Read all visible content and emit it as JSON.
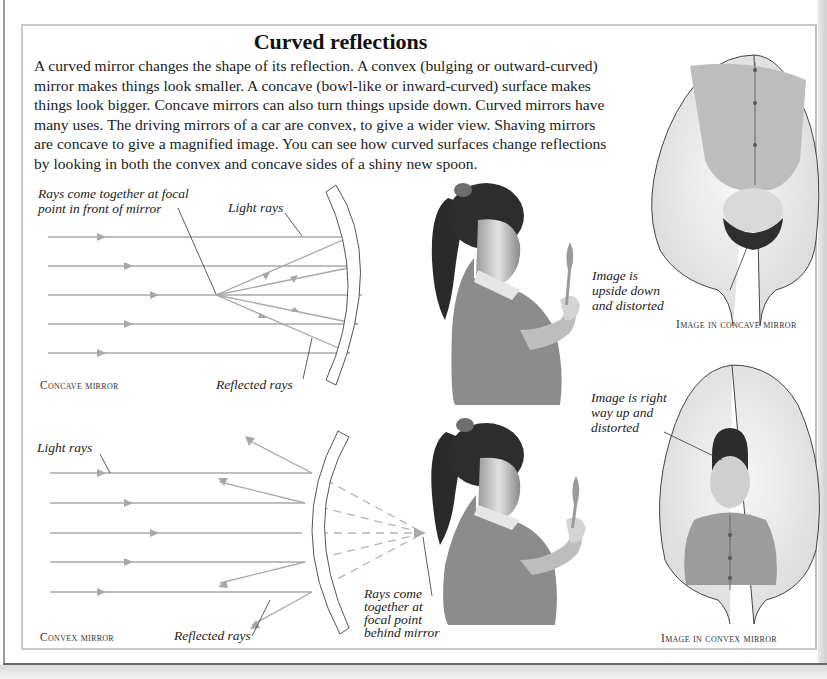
{
  "page": {
    "title": "Curved reflections",
    "intro_lines": [
      "A curved mirror changes the shape of its reflection. A convex (bulging or outward-curved)",
      "mirror makes things look smaller. A concave (bowl-like or inward-curved) surface makes",
      "things look bigger. Concave mirrors can also turn things upside down. Curved mirrors have",
      "many uses. The driving mirrors of a car are convex, to give a wider view. Shaving mirrors",
      "are concave to give a magnified image. You can see how curved surfaces change reflections",
      "by looking in both the convex and concave sides of a shiny new spoon."
    ]
  },
  "concave_diagram": {
    "focal_label_lines": [
      "Rays come together at focal",
      "point in front of mirror"
    ],
    "light_rays_label": "Light rays",
    "reflected_rays_label": "Reflected rays",
    "caption": "Concave mirror"
  },
  "convex_diagram": {
    "light_rays_label": "Light rays",
    "reflected_rays_label": "Reflected rays",
    "focal_label_lines": [
      "Rays come",
      "together at",
      "focal point",
      "behind mirror"
    ],
    "caption": "Convex mirror"
  },
  "concave_spoon": {
    "label_lines": [
      "Image is",
      "upside down",
      "and distorted"
    ],
    "caption": "Image in concave mirror"
  },
  "convex_spoon": {
    "label_lines": [
      "Image is right",
      "way up and",
      "distorted"
    ],
    "caption": "Image in convex mirror"
  },
  "colors": {
    "ray": "#a8a8a8",
    "mirror_outline": "#555555",
    "frame": "#c9c9c9",
    "text": "#1a1a1a"
  }
}
